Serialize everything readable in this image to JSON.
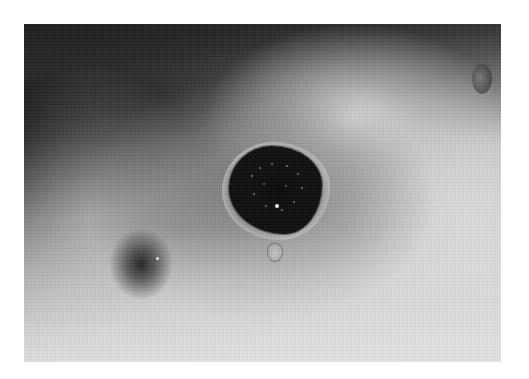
{
  "image": {
    "type": "photograph",
    "color_mode": "grayscale",
    "description": "Close-up clinical photograph of skin with a dark, irregular central lesion surrounded by a gray halo, with a small dark spot to the lower left and a small droplet below the lesion",
    "border_color": "#ffffff",
    "photo_region": {
      "left": 24,
      "top": 24,
      "width": 477,
      "height": 338
    },
    "tones": {
      "darkest": "#000000",
      "midtone": "#8a8a8a",
      "lightest": "#e2e2e2"
    },
    "features": [
      {
        "name": "central-lesion",
        "center": [
          280,
          190
        ],
        "size": [
          100,
          90
        ]
      },
      {
        "name": "dark-spot",
        "center": [
          140,
          265
        ],
        "size": [
          60,
          70
        ]
      },
      {
        "name": "droplet",
        "center": [
          275,
          252
        ],
        "size": [
          14,
          17
        ]
      },
      {
        "name": "dark-corner",
        "position": "top-left"
      }
    ]
  }
}
